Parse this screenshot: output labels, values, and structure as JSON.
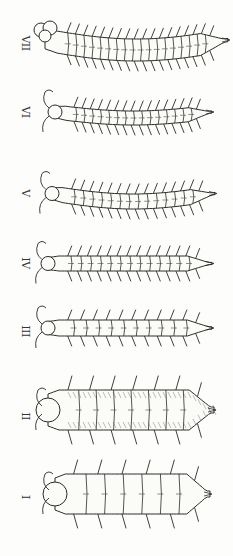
{
  "plate": {
    "background": "#fdfdfb",
    "ink": "#2a2a2a",
    "stages": [
      {
        "label": "VII",
        "label_y": 36,
        "cy": 40,
        "x0": 45,
        "x1": 228,
        "h": 22,
        "segments": 19,
        "curve": -10,
        "legs": 18,
        "head": "lobed",
        "antennae": false
      },
      {
        "label": "VI",
        "label_y": 105,
        "cy": 112,
        "x0": 55,
        "x1": 212,
        "h": 14,
        "segments": 16,
        "curve": -6,
        "legs": 16,
        "head": "round",
        "antennae": true
      },
      {
        "label": "V",
        "label_y": 186,
        "cy": 193,
        "x0": 52,
        "x1": 215,
        "h": 15,
        "segments": 15,
        "curve": -8,
        "legs": 15,
        "head": "round",
        "antennae": true
      },
      {
        "label": "IV",
        "label_y": 256,
        "cy": 263,
        "x0": 48,
        "x1": 212,
        "h": 15,
        "segments": 14,
        "curve": 0,
        "legs": 14,
        "head": "flat",
        "antennae": true
      },
      {
        "label": "III",
        "label_y": 324,
        "cy": 328,
        "x0": 48,
        "x1": 212,
        "h": 16,
        "segments": 11,
        "curve": 0,
        "legs": 11,
        "head": "round",
        "antennae": true
      },
      {
        "label": "II",
        "label_y": 409,
        "cy": 410,
        "x0": 48,
        "x1": 214,
        "h": 40,
        "segments": 8,
        "curve": 0,
        "legs": 7,
        "head": "round",
        "antennae": true,
        "hatched": true
      },
      {
        "label": "I",
        "label_y": 490,
        "cy": 494,
        "x0": 55,
        "x1": 210,
        "h": 40,
        "segments": 7,
        "curve": 0,
        "legs": 6,
        "head": "round",
        "antennae": true
      }
    ]
  }
}
